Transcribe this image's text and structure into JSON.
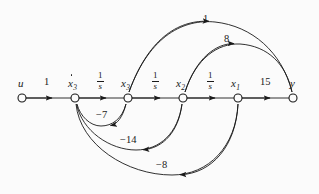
{
  "figure": {
    "kind": "signal-flow-graph",
    "background_color": "#fbfbfb",
    "stroke_color": "#1a1a1a",
    "width": 319,
    "height": 194
  },
  "nodes": [
    {
      "id": "u",
      "label": "u",
      "dot": false,
      "subscript": "",
      "x": 22,
      "y": 98,
      "label_x": 18,
      "label_y": 78
    },
    {
      "id": "xd3",
      "label": "x",
      "dot": true,
      "subscript": "3",
      "x": 75,
      "y": 98,
      "label_x": 68,
      "label_y": 78
    },
    {
      "id": "x3",
      "label": "x",
      "dot": false,
      "subscript": "3",
      "x": 128,
      "y": 98,
      "label_x": 121,
      "label_y": 78
    },
    {
      "id": "x2",
      "label": "x",
      "dot": false,
      "subscript": "2",
      "x": 183,
      "y": 98,
      "label_x": 176,
      "label_y": 78
    },
    {
      "id": "x1",
      "label": "x",
      "dot": false,
      "subscript": "1",
      "x": 238,
      "y": 98,
      "label_x": 231,
      "label_y": 78
    },
    {
      "id": "y",
      "label": "y",
      "dot": false,
      "subscript": "",
      "x": 293,
      "y": 98,
      "label_x": 290,
      "label_y": 78
    }
  ],
  "edges": [
    {
      "id": "u-to-xd3",
      "from": "u",
      "to": "xd3",
      "weight": "1",
      "kind": "straight",
      "fraction": false,
      "label_x": 44,
      "label_y": 77
    },
    {
      "id": "xd3-to-x3",
      "from": "xd3",
      "to": "x3",
      "weight": "1/s",
      "kind": "straight",
      "fraction": true,
      "num": "1",
      "den": "s",
      "label_x": 97,
      "label_y": 72
    },
    {
      "id": "x3-to-x2",
      "from": "x3",
      "to": "x2",
      "weight": "1/s",
      "kind": "straight",
      "fraction": true,
      "num": "1",
      "den": "s",
      "label_x": 152,
      "label_y": 72
    },
    {
      "id": "x2-to-x1",
      "from": "x2",
      "to": "x1",
      "weight": "1/s",
      "kind": "straight",
      "fraction": true,
      "num": "1",
      "den": "s",
      "label_x": 207,
      "label_y": 72
    },
    {
      "id": "x1-to-y",
      "from": "x1",
      "to": "y",
      "weight": "15",
      "kind": "straight",
      "fraction": false,
      "label_x": 260,
      "label_y": 77
    },
    {
      "id": "x3-to-y",
      "from": "x3",
      "to": "y",
      "weight": "1",
      "kind": "arc-top",
      "fraction": false,
      "label_x": 203,
      "label_y": 14
    },
    {
      "id": "x2-to-y",
      "from": "x2",
      "to": "y",
      "weight": "8",
      "kind": "arc-top",
      "fraction": false,
      "label_x": 224,
      "label_y": 34
    },
    {
      "id": "x3-to-xd3",
      "from": "x3",
      "to": "xd3",
      "weight": "−7",
      "kind": "arc-bottom",
      "fraction": false,
      "label_x": 96,
      "label_y": 110
    },
    {
      "id": "x2-to-xd3",
      "from": "x2",
      "to": "xd3",
      "weight": "−14",
      "kind": "arc-bottom",
      "fraction": false,
      "label_x": 120,
      "label_y": 135
    },
    {
      "id": "x1-to-xd3",
      "from": "x1",
      "to": "xd3",
      "weight": "−8",
      "kind": "arc-bottom",
      "fraction": false,
      "label_x": 156,
      "label_y": 160
    }
  ]
}
